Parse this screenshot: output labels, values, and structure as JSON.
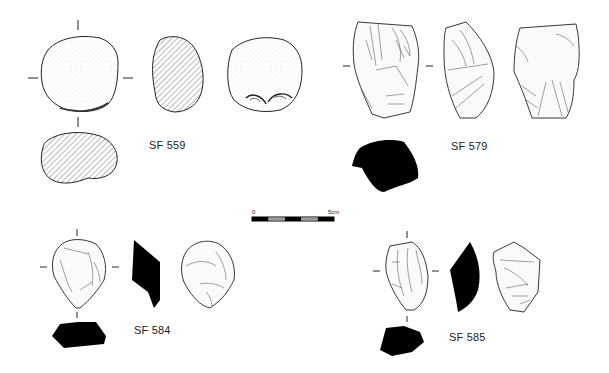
{
  "figure": {
    "background": "#ffffff",
    "ink_color": "#1a1a1a",
    "section_fill": "#000000",
    "hatch_color": "#555555"
  },
  "scale_bar": {
    "start_label": "0",
    "end_label": "5cm",
    "segments": 5
  },
  "artifacts": [
    {
      "id": "sf559",
      "label": "SF 559",
      "type": "hammerstone",
      "views": [
        "face",
        "profile-section",
        "reverse-face",
        "plan-section"
      ],
      "section_style": "hatched"
    },
    {
      "id": "sf579",
      "label": "SF 579",
      "type": "core",
      "views": [
        "face",
        "side",
        "reverse-face",
        "plan-section"
      ],
      "section_style": "solid"
    },
    {
      "id": "sf584",
      "label": "SF 584",
      "type": "flake-core",
      "views": [
        "face",
        "profile-section",
        "reverse-face",
        "plan-section"
      ],
      "section_style": "solid"
    },
    {
      "id": "sf585",
      "label": "SF 585",
      "type": "core",
      "views": [
        "face",
        "profile-section",
        "reverse-face",
        "plan-section"
      ],
      "section_style": "solid"
    }
  ]
}
